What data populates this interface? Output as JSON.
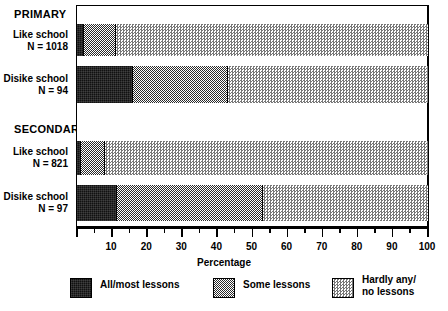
{
  "chart_data": {
    "type": "bar",
    "orientation": "horizontal",
    "stacked": true,
    "title": "",
    "xlabel": "Percentage",
    "ylabel": "",
    "xlim": [
      0,
      100
    ],
    "xticks": [
      0,
      10,
      20,
      30,
      40,
      50,
      60,
      70,
      80,
      90,
      100
    ],
    "xtick_labels": [
      "",
      "10",
      "20",
      "30",
      "40",
      "50",
      "60",
      "70",
      "80",
      "90",
      "100"
    ],
    "minor_tick_step": 5,
    "grid": false,
    "legend_position": "bottom",
    "series": [
      {
        "name": "All/most lessons",
        "color": "#111111",
        "values": [
          2,
          16,
          1,
          11.5
        ]
      },
      {
        "name": "Some lessons",
        "color": "#808080",
        "values": [
          9,
          27,
          7,
          41.5
        ]
      },
      {
        "name": "Hardly any/no lessons",
        "color": "#d9d9d9",
        "values": [
          89,
          57,
          92,
          47
        ]
      }
    ],
    "categories": [
      "Like school N = 1018",
      "Disike school N = 94",
      "Like school N = 821",
      "Disike school N = 97"
    ],
    "groups": [
      {
        "label": "PRIMARY",
        "rows": [
          0,
          1
        ]
      },
      {
        "label": "SECONDARY",
        "rows": [
          2,
          3
        ]
      }
    ]
  },
  "groups": [
    {
      "label": "PRIMARY"
    },
    {
      "label": "SECONDARY"
    }
  ],
  "rows": [
    {
      "line1": "Like school",
      "line2": "N = 1018"
    },
    {
      "line1": "Disike school",
      "line2": "N = 94"
    },
    {
      "line1": "Like school",
      "line2": "N = 821"
    },
    {
      "line1": "Disike school",
      "line2": "N = 97"
    }
  ],
  "axis": {
    "title": "Percentage",
    "labels": [
      "10",
      "20",
      "30",
      "40",
      "50",
      "60",
      "70",
      "80",
      "90",
      "100"
    ]
  },
  "legend": [
    {
      "line1": "All/most lessons",
      "line2": ""
    },
    {
      "line1": "Some lessons",
      "line2": ""
    },
    {
      "line1": "Hardly any/",
      "line2": "no lessons"
    }
  ]
}
